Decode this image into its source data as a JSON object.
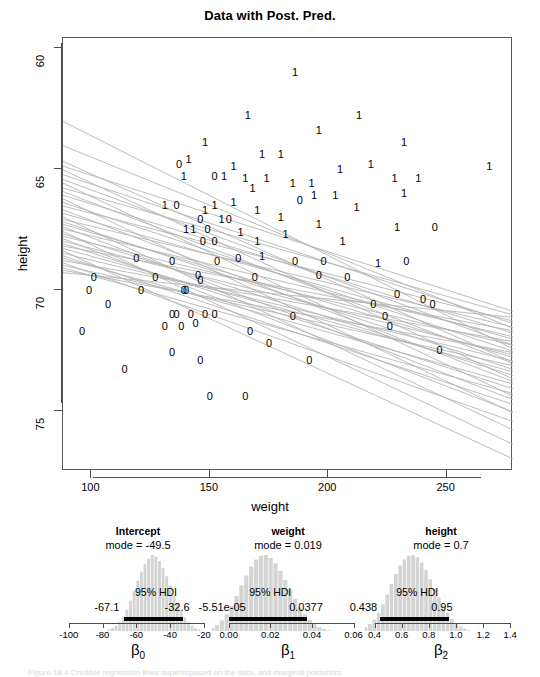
{
  "figure": {
    "caption": "Figure 18.4 Credible regression lines superimposed on the data, and marginal posteriors."
  },
  "main": {
    "title": "Data with Post. Pred.",
    "xlabel": "weight",
    "ylabel": "height",
    "xticks": [
      "100",
      "150",
      "200",
      "250"
    ],
    "yticks": [
      "75",
      "70",
      "65",
      "60"
    ]
  },
  "panels": [
    {
      "title": "Intercept",
      "mode_label": "mode = -49.5",
      "hdi_label": "95% HDI",
      "hdi_low": "-67.1",
      "hdi_high": "-32.6",
      "beta": "β",
      "beta_sub": "0",
      "ticks": [
        "-100",
        "-80",
        "-60",
        "-40",
        "-20"
      ]
    },
    {
      "title": "weight",
      "mode_label": "mode = 0.019",
      "hdi_label": "95% HDI",
      "hdi_low": "-5.51e-05",
      "hdi_high": "0.0377",
      "beta": "β",
      "beta_sub": "1",
      "ticks": [
        "0.00",
        "0.02",
        "0.04",
        "0.06"
      ]
    },
    {
      "title": "height",
      "mode_label": "mode = 0.7",
      "hdi_label": "95% HDI",
      "hdi_low": "0.438",
      "hdi_high": "0.95",
      "beta": "β",
      "beta_sub": "2",
      "ticks": [
        "0.4",
        "0.6",
        "0.8",
        "1.0",
        "1.2",
        "1.4"
      ]
    }
  ],
  "chart_data": {
    "type": "scatter",
    "title": "Data with Post. Pred.",
    "xlabel": "weight",
    "ylabel": "height",
    "xlim": [
      88,
      278
    ],
    "ylim": [
      57.5,
      75.4
    ],
    "xticks": [
      100,
      150,
      200,
      250
    ],
    "yticks": [
      60,
      65,
      70,
      75
    ],
    "grid": false,
    "point_marker": "group label digit (0 = female, 1 = male)",
    "colors": {
      "points": "#000000",
      "lines": "#b3b3b3",
      "frame": "#595959"
    },
    "points": [
      {
        "x": 186,
        "y": 74.0,
        "label": "1"
      },
      {
        "x": 166,
        "y": 72.2,
        "label": "1"
      },
      {
        "x": 213,
        "y": 72.2,
        "label": "1"
      },
      {
        "x": 196,
        "y": 71.6,
        "label": "1"
      },
      {
        "x": 148,
        "y": 71.1,
        "label": "1"
      },
      {
        "x": 232,
        "y": 71.1,
        "label": "1"
      },
      {
        "x": 172,
        "y": 70.6,
        "label": "1"
      },
      {
        "x": 180,
        "y": 70.6,
        "label": "1"
      },
      {
        "x": 137,
        "y": 70.2,
        "label": "0"
      },
      {
        "x": 141,
        "y": 70.4,
        "label": "1"
      },
      {
        "x": 160,
        "y": 70.1,
        "label": "1"
      },
      {
        "x": 205,
        "y": 70.0,
        "label": "1"
      },
      {
        "x": 218,
        "y": 70.2,
        "label": "1"
      },
      {
        "x": 268,
        "y": 70.1,
        "label": "1"
      },
      {
        "x": 139,
        "y": 69.7,
        "label": "1"
      },
      {
        "x": 152,
        "y": 69.7,
        "label": "0"
      },
      {
        "x": 156,
        "y": 69.7,
        "label": "1"
      },
      {
        "x": 165,
        "y": 69.6,
        "label": "1"
      },
      {
        "x": 174,
        "y": 69.6,
        "label": "1"
      },
      {
        "x": 185,
        "y": 69.4,
        "label": "1"
      },
      {
        "x": 193,
        "y": 69.4,
        "label": "1"
      },
      {
        "x": 228,
        "y": 69.6,
        "label": "1"
      },
      {
        "x": 238,
        "y": 69.6,
        "label": "1"
      },
      {
        "x": 168,
        "y": 69.2,
        "label": "1"
      },
      {
        "x": 203,
        "y": 68.9,
        "label": "1"
      },
      {
        "x": 232,
        "y": 69.0,
        "label": "1"
      },
      {
        "x": 160,
        "y": 68.6,
        "label": "1"
      },
      {
        "x": 148,
        "y": 68.3,
        "label": "1"
      },
      {
        "x": 152,
        "y": 68.5,
        "label": "1"
      },
      {
        "x": 188,
        "y": 68.7,
        "label": "0"
      },
      {
        "x": 194,
        "y": 68.9,
        "label": "1"
      },
      {
        "x": 131,
        "y": 68.5,
        "label": "1"
      },
      {
        "x": 136,
        "y": 68.5,
        "label": "0"
      },
      {
        "x": 170,
        "y": 68.3,
        "label": "1"
      },
      {
        "x": 212,
        "y": 68.4,
        "label": "1"
      },
      {
        "x": 180,
        "y": 68.0,
        "label": "1"
      },
      {
        "x": 146,
        "y": 67.9,
        "label": "0"
      },
      {
        "x": 155,
        "y": 67.9,
        "label": "1"
      },
      {
        "x": 158,
        "y": 67.9,
        "label": "0"
      },
      {
        "x": 196,
        "y": 67.7,
        "label": "1"
      },
      {
        "x": 229,
        "y": 67.6,
        "label": "1"
      },
      {
        "x": 245,
        "y": 67.6,
        "label": "0"
      },
      {
        "x": 140,
        "y": 67.5,
        "label": "1"
      },
      {
        "x": 143,
        "y": 67.5,
        "label": "1"
      },
      {
        "x": 149,
        "y": 67.5,
        "label": "0"
      },
      {
        "x": 163,
        "y": 67.4,
        "label": "1"
      },
      {
        "x": 182,
        "y": 67.3,
        "label": "1"
      },
      {
        "x": 147,
        "y": 67.0,
        "label": "0"
      },
      {
        "x": 152,
        "y": 67.0,
        "label": "0"
      },
      {
        "x": 170,
        "y": 67.0,
        "label": "1"
      },
      {
        "x": 206,
        "y": 67.0,
        "label": "1"
      },
      {
        "x": 119,
        "y": 66.3,
        "label": "0"
      },
      {
        "x": 134,
        "y": 66.2,
        "label": "0"
      },
      {
        "x": 153,
        "y": 66.2,
        "label": "0"
      },
      {
        "x": 162,
        "y": 66.3,
        "label": "0"
      },
      {
        "x": 172,
        "y": 66.4,
        "label": "1"
      },
      {
        "x": 186,
        "y": 66.2,
        "label": "0"
      },
      {
        "x": 198,
        "y": 66.2,
        "label": "0"
      },
      {
        "x": 221,
        "y": 66.1,
        "label": "1"
      },
      {
        "x": 233,
        "y": 66.2,
        "label": "0"
      },
      {
        "x": 101,
        "y": 65.5,
        "label": "0"
      },
      {
        "x": 127,
        "y": 65.5,
        "label": "0"
      },
      {
        "x": 145,
        "y": 65.6,
        "label": "0"
      },
      {
        "x": 146,
        "y": 65.4,
        "label": "0"
      },
      {
        "x": 169,
        "y": 65.5,
        "label": "0"
      },
      {
        "x": 196,
        "y": 65.6,
        "label": "0"
      },
      {
        "x": 208,
        "y": 65.5,
        "label": "0"
      },
      {
        "x": 99,
        "y": 65.0,
        "label": "0"
      },
      {
        "x": 121,
        "y": 65.0,
        "label": "0"
      },
      {
        "x": 139,
        "y": 65.0,
        "label": "0"
      },
      {
        "x": 140,
        "y": 65.0,
        "label": "0"
      },
      {
        "x": 229,
        "y": 64.8,
        "label": "0"
      },
      {
        "x": 240,
        "y": 64.6,
        "label": "0"
      },
      {
        "x": 107,
        "y": 64.4,
        "label": "0"
      },
      {
        "x": 219,
        "y": 64.4,
        "label": "0"
      },
      {
        "x": 244,
        "y": 64.4,
        "label": "0"
      },
      {
        "x": 134,
        "y": 64.0,
        "label": "0"
      },
      {
        "x": 136,
        "y": 64.0,
        "label": "0"
      },
      {
        "x": 142,
        "y": 64.0,
        "label": "0"
      },
      {
        "x": 148,
        "y": 64.0,
        "label": "0"
      },
      {
        "x": 152,
        "y": 64.0,
        "label": "0"
      },
      {
        "x": 185,
        "y": 63.9,
        "label": "0"
      },
      {
        "x": 224,
        "y": 63.9,
        "label": "0"
      },
      {
        "x": 131,
        "y": 63.5,
        "label": "0"
      },
      {
        "x": 138,
        "y": 63.5,
        "label": "0"
      },
      {
        "x": 144,
        "y": 63.6,
        "label": "0"
      },
      {
        "x": 226,
        "y": 63.5,
        "label": "0"
      },
      {
        "x": 167,
        "y": 63.3,
        "label": "0"
      },
      {
        "x": 96,
        "y": 63.3,
        "label": "0"
      },
      {
        "x": 175,
        "y": 62.8,
        "label": "0"
      },
      {
        "x": 134,
        "y": 62.4,
        "label": "0"
      },
      {
        "x": 247,
        "y": 62.5,
        "label": "0"
      },
      {
        "x": 146,
        "y": 62.1,
        "label": "0"
      },
      {
        "x": 192,
        "y": 62.1,
        "label": "0"
      },
      {
        "x": 114,
        "y": 61.7,
        "label": "0"
      },
      {
        "x": 150,
        "y": 60.6,
        "label": "0"
      },
      {
        "x": 165,
        "y": 60.6,
        "label": "0"
      }
    ],
    "posterior_lines_note": "~40 semi-transparent gray credible regression lines, negative slope, fanning from weight≈88 (height≈66.0–72.0) to weight≈278 (height≈57.8–64.5)",
    "posterior_lines": [
      {
        "y0": 71.95,
        "y1": 62.55
      },
      {
        "y0": 70.95,
        "y1": 63.4
      },
      {
        "y0": 70.3,
        "y1": 62.0
      },
      {
        "y0": 70.1,
        "y1": 64.1
      },
      {
        "y0": 69.95,
        "y1": 61.3
      },
      {
        "y0": 69.75,
        "y1": 63.6
      },
      {
        "y0": 69.55,
        "y1": 62.7
      },
      {
        "y0": 69.4,
        "y1": 60.6
      },
      {
        "y0": 69.2,
        "y1": 63.95
      },
      {
        "y0": 69.05,
        "y1": 61.95
      },
      {
        "y0": 68.9,
        "y1": 63.2
      },
      {
        "y0": 68.75,
        "y1": 59.9
      },
      {
        "y0": 68.6,
        "y1": 62.45
      },
      {
        "y0": 68.45,
        "y1": 63.7
      },
      {
        "y0": 68.3,
        "y1": 61.2
      },
      {
        "y0": 68.15,
        "y1": 62.95
      },
      {
        "y0": 68.0,
        "y1": 59.2
      },
      {
        "y0": 67.9,
        "y1": 63.45
      },
      {
        "y0": 67.8,
        "y1": 61.7
      },
      {
        "y0": 67.7,
        "y1": 62.2
      },
      {
        "y0": 67.6,
        "y1": 60.45
      },
      {
        "y0": 67.5,
        "y1": 63.05
      },
      {
        "y0": 67.4,
        "y1": 58.6
      },
      {
        "y0": 67.3,
        "y1": 61.45
      },
      {
        "y0": 67.2,
        "y1": 62.7
      },
      {
        "y0": 67.1,
        "y1": 59.95
      },
      {
        "y0": 67.0,
        "y1": 62.3
      },
      {
        "y0": 66.9,
        "y1": 60.9
      },
      {
        "y0": 66.8,
        "y1": 63.3
      },
      {
        "y0": 66.7,
        "y1": 61.6
      },
      {
        "y0": 66.6,
        "y1": 58.0
      },
      {
        "y0": 66.5,
        "y1": 62.05
      },
      {
        "y0": 66.4,
        "y1": 60.25
      },
      {
        "y0": 66.3,
        "y1": 61.1
      },
      {
        "y0": 66.2,
        "y1": 62.85
      },
      {
        "y0": 66.1,
        "y1": 59.55
      },
      {
        "y0": 66.0,
        "y1": 61.85
      },
      {
        "y0": 65.9,
        "y1": 60.7
      },
      {
        "y0": 65.8,
        "y1": 62.4
      },
      {
        "y0": 65.7,
        "y1": 63.85
      }
    ]
  },
  "posterior_data": [
    {
      "name": "Intercept",
      "type": "histogram",
      "xlim": [
        -104,
        -14
      ],
      "mode": -49.5,
      "hdi": [
        -67.1,
        -32.6
      ],
      "bin_heights": [
        0.02,
        0.04,
        0.07,
        0.12,
        0.19,
        0.28,
        0.4,
        0.53,
        0.66,
        0.78,
        0.88,
        0.95,
        1.0,
        0.98,
        0.92,
        0.83,
        0.72,
        0.6,
        0.47,
        0.36,
        0.26,
        0.18,
        0.12,
        0.07,
        0.04,
        0.02
      ]
    },
    {
      "name": "weight",
      "type": "histogram",
      "xlim": [
        -0.008,
        0.065
      ],
      "mode": 0.019,
      "hdi": [
        -5.51e-05,
        0.0377
      ],
      "bin_heights": [
        0.02,
        0.04,
        0.08,
        0.14,
        0.22,
        0.33,
        0.46,
        0.6,
        0.73,
        0.85,
        0.94,
        0.99,
        1.0,
        0.96,
        0.89,
        0.79,
        0.67,
        0.55,
        0.42,
        0.31,
        0.22,
        0.15,
        0.09,
        0.05,
        0.03,
        0.01
      ]
    },
    {
      "name": "height",
      "type": "histogram",
      "xlim": [
        0.33,
        1.45
      ],
      "mode": 0.7,
      "hdi": [
        0.438,
        0.95
      ],
      "bin_heights": [
        0.02,
        0.05,
        0.09,
        0.15,
        0.24,
        0.35,
        0.48,
        0.62,
        0.75,
        0.86,
        0.94,
        0.99,
        1.0,
        0.97,
        0.9,
        0.8,
        0.68,
        0.56,
        0.44,
        0.33,
        0.24,
        0.16,
        0.1,
        0.06,
        0.03,
        0.01
      ]
    }
  ]
}
